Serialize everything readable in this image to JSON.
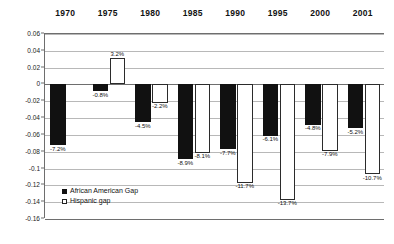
{
  "chart_data": {
    "type": "bar",
    "title": "",
    "subtitle": "",
    "xlabel": "",
    "ylabel": "",
    "grid": true,
    "legend_position": "inside-bottom-left",
    "categories": [
      "1970",
      "1975",
      "1980",
      "1985",
      "1990",
      "1995",
      "2000",
      "2001"
    ],
    "ylim": [
      -0.16,
      0.06
    ],
    "ytick_labels": [
      "0.06",
      "0.04",
      "0.02",
      "0",
      "-0.02",
      "-0.04",
      "-0.06",
      "-0.08",
      "-0.1",
      "-0.12",
      "-0.14",
      "-0.16"
    ],
    "ytick_values": [
      0.06,
      0.04,
      0.02,
      0,
      -0.02,
      -0.04,
      -0.06,
      -0.08,
      -0.1,
      -0.12,
      -0.14,
      -0.16
    ],
    "series": [
      {
        "name": "African American Gap",
        "style": "black",
        "values": [
          -0.072,
          -0.008,
          -0.045,
          -0.089,
          -0.077,
          -0.061,
          -0.048,
          -0.052
        ],
        "labels": [
          "-7.2%",
          "-0.8%",
          "-4.5%",
          "-8.9%",
          "-7.7%",
          "-6.1%",
          "-4.8%",
          "-5.2%"
        ]
      },
      {
        "name": "Hispanic gap",
        "style": "white",
        "values": [
          null,
          0.032,
          -0.022,
          -0.081,
          -0.117,
          -0.137,
          -0.079,
          -0.107
        ],
        "labels": [
          "",
          "3.2%",
          "-2.2%",
          "-8.1%",
          "-11.7%",
          "-13.7%",
          "-7.9%",
          "-10.7%"
        ]
      }
    ]
  },
  "legend": {
    "items": [
      {
        "label": "African American Gap",
        "style": "black"
      },
      {
        "label": "Hispanic gap",
        "style": "white"
      }
    ]
  }
}
